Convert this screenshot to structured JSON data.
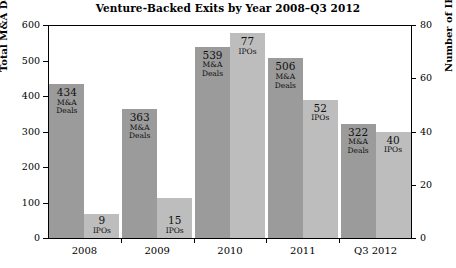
{
  "chart_data": {
    "type": "bar",
    "title": "Venture-Backed Exits by Year 2008–Q3 2012",
    "categories": [
      "2008",
      "2009",
      "2010",
      "2011",
      "Q3 2012"
    ],
    "series": [
      {
        "name": "Total M&A Deals",
        "unit": "M&A Deals",
        "axis": "left",
        "color": "#9b9b9b",
        "values": [
          434,
          363,
          539,
          506,
          322
        ]
      },
      {
        "name": "Number of IPOs*",
        "unit": "IPOs",
        "axis": "right",
        "color": "#bdbdbd",
        "values": [
          9,
          15,
          77,
          52,
          40
        ]
      }
    ],
    "ylabel": "Total M&A Deals",
    "ylabel_right": "Number of IPOs*",
    "xlabel": "",
    "ylim": [
      0,
      600
    ],
    "ylim_right": [
      0,
      80
    ],
    "yticks": [
      0,
      100,
      200,
      300,
      400,
      500,
      600
    ],
    "yticks_right": [
      0,
      20,
      40,
      60,
      80
    ],
    "grid": false,
    "legend": "none"
  },
  "labels": {
    "ma_value_2008": "434",
    "ma_unit_2008": "M&A\nDeals",
    "ipo_value_2008": "9",
    "ipo_unit_2008": "IPOs"
  }
}
